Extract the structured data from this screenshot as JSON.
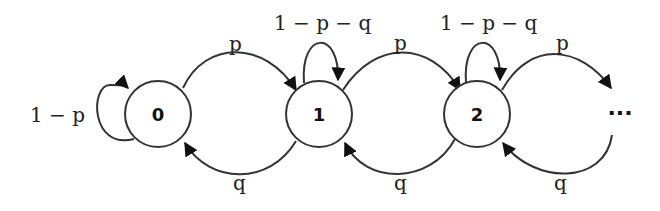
{
  "diagram": {
    "type": "markov-chain",
    "nodes": [
      {
        "id": "0",
        "label": "0"
      },
      {
        "id": "1",
        "label": "1"
      },
      {
        "id": "2",
        "label": "2"
      }
    ],
    "continuation": "···",
    "edges": [
      {
        "from": "0",
        "to": "0",
        "label": "1 − p"
      },
      {
        "from": "0",
        "to": "1",
        "label": "p"
      },
      {
        "from": "1",
        "to": "0",
        "label": "q"
      },
      {
        "from": "1",
        "to": "1",
        "label": "1 − p − q"
      },
      {
        "from": "1",
        "to": "2",
        "label": "p"
      },
      {
        "from": "2",
        "to": "1",
        "label": "q"
      },
      {
        "from": "2",
        "to": "2",
        "label": "1 − p − q"
      },
      {
        "from": "2",
        "to": "…",
        "label": "p"
      },
      {
        "from": "…",
        "to": "2",
        "label": "q"
      }
    ]
  }
}
